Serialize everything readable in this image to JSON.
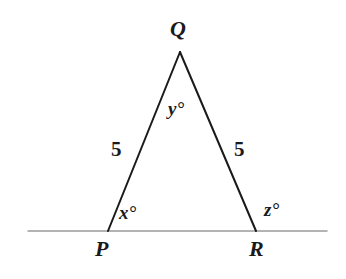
{
  "figure": {
    "kind": "geometry-diagram",
    "background_color": "#ffffff",
    "stroke_color": "#1a1a1a",
    "baseline_color": "#9a9a9a",
    "width": 346,
    "height": 279
  },
  "vertices": {
    "Q": {
      "label": "Q",
      "x": 180,
      "y": 52
    },
    "P": {
      "label": "P",
      "x": 108,
      "y": 231
    },
    "R": {
      "label": "R",
      "x": 256,
      "y": 231
    }
  },
  "baseline": {
    "name": "horizontal-line",
    "x1": 28,
    "y1": 231,
    "x2": 327,
    "y2": 231
  },
  "side_labels": {
    "left": "5",
    "right": "5"
  },
  "angle_labels": {
    "apex": "y°",
    "left_base": "x°",
    "right_exterior": "z°"
  }
}
